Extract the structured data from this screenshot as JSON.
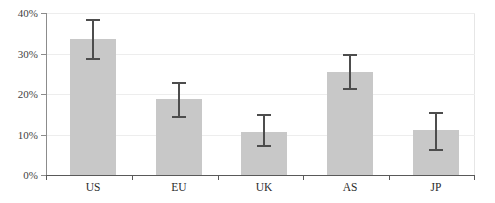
{
  "chart_data": {
    "type": "bar",
    "title": "",
    "xlabel": "",
    "ylabel": "",
    "categories": [
      "US",
      "EU",
      "UK",
      "AS",
      "JP"
    ],
    "values": [
      33.5,
      18.7,
      10.6,
      25.4,
      11.0
    ],
    "errors_low": [
      29.0,
      14.5,
      7.5,
      21.5,
      6.5
    ],
    "errors_high": [
      38.5,
      23.0,
      15.0,
      30.0,
      15.5
    ],
    "ylim": [
      0,
      40
    ],
    "yticks": [
      0,
      10,
      20,
      30,
      40
    ],
    "ytick_labels": [
      "0%",
      "10%",
      "20%",
      "30%",
      "40%"
    ],
    "grid": true,
    "legend": "none",
    "bar_color": "#c8c8c8",
    "error_color": "#4d4d4d",
    "gridline_color": "#ededed",
    "axis_color": "#595959"
  }
}
